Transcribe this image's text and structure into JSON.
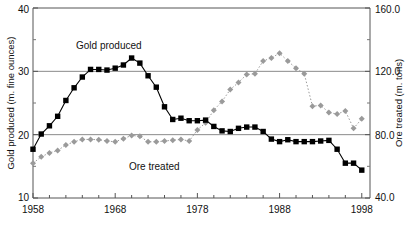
{
  "chart_data": {
    "type": "line",
    "title": "",
    "subtitle": "",
    "xlabel": "",
    "ylabel": "Gold produced (m. fine ounces)",
    "y2label": "Ore treated (m. tons)",
    "xlim": [
      1958,
      1999
    ],
    "ylim": [
      10,
      40
    ],
    "y2lim": [
      40.0,
      160.0
    ],
    "grid": true,
    "gridlines_y": [
      20,
      30
    ],
    "legend_position": "inline-annotation",
    "x_ticks_major": [
      1958,
      1968,
      1978,
      1988,
      1998
    ],
    "x_tick_labels": [
      "1958",
      "1968",
      "1978",
      "1988",
      "1998"
    ],
    "y_ticks_left": [
      10,
      20,
      30,
      40
    ],
    "y_tick_labels_left": [
      "10",
      "20",
      "30",
      "40"
    ],
    "y_ticks_right": [
      40.0,
      80.0,
      120.0,
      160.0
    ],
    "y_tick_labels_right": [
      "40.0",
      "80.0",
      "120.0",
      "160.0"
    ],
    "x": [
      1958,
      1959,
      1960,
      1961,
      1962,
      1963,
      1964,
      1965,
      1966,
      1967,
      1968,
      1969,
      1970,
      1971,
      1972,
      1973,
      1974,
      1975,
      1976,
      1977,
      1978,
      1979,
      1980,
      1981,
      1982,
      1983,
      1984,
      1985,
      1986,
      1987,
      1988,
      1989,
      1990,
      1991,
      1992,
      1993,
      1994,
      1995,
      1996,
      1997,
      1998
    ],
    "series": [
      {
        "name": "Gold produced",
        "axis": "left",
        "units": "m. fine ounces",
        "color": "#000000",
        "marker": "square",
        "linestyle": "solid",
        "values": [
          17.7,
          20.1,
          21.4,
          22.9,
          25.4,
          27.4,
          29.1,
          30.3,
          30.3,
          30.2,
          30.5,
          31.0,
          32.1,
          31.3,
          29.3,
          27.5,
          24.4,
          22.4,
          22.6,
          22.2,
          22.2,
          22.3,
          21.3,
          20.6,
          20.5,
          21.0,
          21.2,
          21.2,
          20.5,
          19.3,
          18.9,
          19.2,
          18.9,
          18.9,
          18.9,
          19.0,
          19.1,
          17.7,
          15.5,
          15.5,
          14.4
        ]
      },
      {
        "name": "Ore treated",
        "axis": "right",
        "units": "m. tons",
        "color": "#9a9a9a",
        "marker": "diamond",
        "linestyle": "dotted",
        "values": [
          62.0,
          66.0,
          68.5,
          70.0,
          73.5,
          75.5,
          77.0,
          77.0,
          76.8,
          76.0,
          75.5,
          77.5,
          79.5,
          79.0,
          75.5,
          75.5,
          76.0,
          76.5,
          77.0,
          76.0,
          83.0,
          87.5,
          95.5,
          101.0,
          108.5,
          113.0,
          118.0,
          118.5,
          126.5,
          128.5,
          131.5,
          126.5,
          122.0,
          118.5,
          98.0,
          98.5,
          94.0,
          93.0,
          95.0,
          84.0,
          90.0
        ]
      }
    ],
    "annotations": [
      {
        "text": "Gold produced",
        "series": "Gold produced",
        "x_px": 76,
        "y_px": 49
      },
      {
        "text": "Ore treated",
        "series": "Ore treated",
        "x_px": 129,
        "y_px": 170
      }
    ]
  }
}
